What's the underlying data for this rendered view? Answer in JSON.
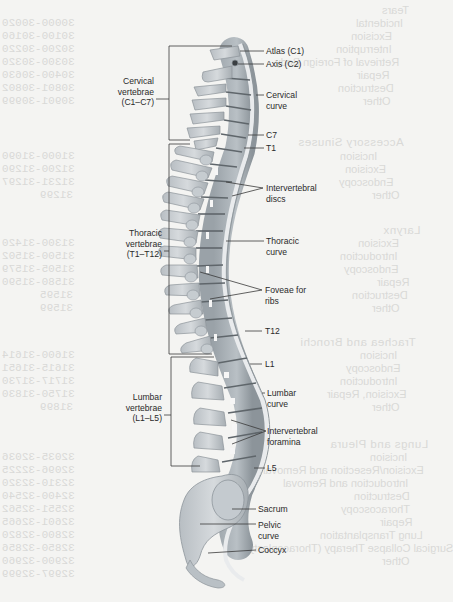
{
  "diagram": {
    "colors": {
      "bone": "#cfd3d6",
      "bone_shadow": "#9aa1a6",
      "disc": "#6f777c",
      "curve_line": "#e8eaec",
      "leader": "#333333",
      "background": "#f4f4f2"
    },
    "region_labels": [
      {
        "id": "cervical",
        "text": "Cervical\nvertebrae\n(C1–C7)"
      },
      {
        "id": "thoracic",
        "text": "Thoracic\nvertebrae\n(T1–T12)"
      },
      {
        "id": "lumbar",
        "text": "Lumbar\nvertebrae\n(L1–L5)"
      }
    ],
    "right_labels": [
      {
        "id": "atlas",
        "text": "Atlas (C1)"
      },
      {
        "id": "axis",
        "text": "Axis (C2)"
      },
      {
        "id": "cervical-curve",
        "text": "Cervical\ncurve"
      },
      {
        "id": "c7",
        "text": "C7"
      },
      {
        "id": "t1",
        "text": "T1"
      },
      {
        "id": "intervertebral-discs",
        "text": "Intervertebral\ndiscs"
      },
      {
        "id": "thoracic-curve",
        "text": "Thoracic\ncurve"
      },
      {
        "id": "foveae",
        "text": "Foveae for\nribs"
      },
      {
        "id": "t12",
        "text": "T12"
      },
      {
        "id": "l1",
        "text": "L1"
      },
      {
        "id": "lumbar-curve",
        "text": "Lumbar\ncurve"
      },
      {
        "id": "intervertebral-foramina",
        "text": "Intervertebral\nforamina"
      },
      {
        "id": "l5",
        "text": "L5"
      },
      {
        "id": "sacrum",
        "text": "Sacrum"
      },
      {
        "id": "pelvic-curve",
        "text": "Pelvic\ncurve"
      },
      {
        "id": "coccyx",
        "text": "Coccyx"
      }
    ]
  },
  "show_through_text": {
    "lines": [
      "Tears",
      "Incidental",
      "Excision",
      "Interruption",
      "Retrieval of Foreign Body",
      "Repair",
      "Destruction",
      "Other",
      "Accessory Sinuses",
      "Incision",
      "Excision",
      "Endoscopy",
      "Other",
      "Larynx",
      "Excision",
      "Introduction",
      "Endoscopy",
      "Repair",
      "Destruction",
      "Other",
      "Trachea and Bronchi",
      "Incision",
      "Endoscopy",
      "Introduction",
      "Excision, Repair",
      "Other",
      "Lungs and Pleura",
      "Incision",
      "Excision/Resection and Removal",
      "Introduction and Removal",
      "Destruction",
      "Thoracoscopy",
      "Repair",
      "Lung Transplantation",
      "Surgical Collapse Therapy (Thoracoplasty)",
      "Other"
    ],
    "codes": [
      "30000-30020",
      "30100-30160",
      "30200-30220",
      "30300-30320",
      "30400-30630",
      "30801-30802",
      "30901-30999",
      "31000-31090",
      "31200-31290",
      "31231-31297",
      "31299",
      "31300-31420",
      "31500-31502",
      "31505-31579",
      "31580-31590",
      "31595",
      "31599",
      "31600-31614",
      "31615-31651",
      "31717-31730",
      "31750-31830",
      "31899",
      "32035-32036",
      "32096-32225",
      "32310-32320",
      "32400-32540",
      "32551-32562",
      "32601-32665",
      "32800-32820",
      "32850-32856",
      "32900-32960",
      "32997-32999"
    ]
  }
}
